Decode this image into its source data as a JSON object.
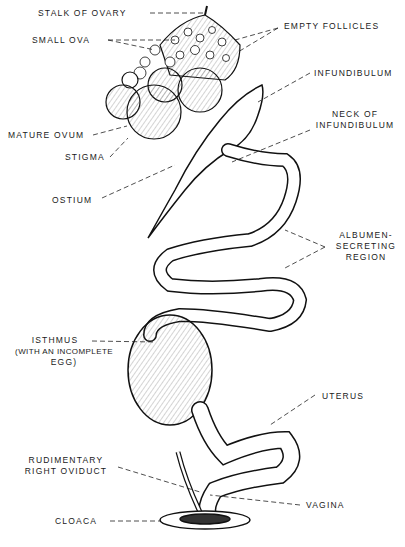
{
  "diagram": {
    "labels": {
      "stalk_of_ovary": "STALK OF OVARY",
      "small_ova": "SMALL OVA",
      "empty_follicles": "EMPTY FOLLICLES",
      "infundibulum": "INFUNDIBULUM",
      "neck_1": "NECK OF",
      "neck_2": "INFUNDIBULUM",
      "mature_ovum": "MATURE OVUM",
      "stigma": "STIGMA",
      "ostium": "OSTIUM",
      "albumen_1": "ALBUMEN-",
      "albumen_2": "SECRETING",
      "albumen_3": "REGION",
      "isthmus_1": "ISTHMUS",
      "isthmus_2": "(WITH AN INCOMPLETE",
      "isthmus_3": "EGG)",
      "uterus": "UTERUS",
      "rudimentary_1": "RUDIMENTARY",
      "rudimentary_2": "RIGHT OVIDUCT",
      "vagina": "VAGINA",
      "cloaca": "CLOACA"
    }
  }
}
